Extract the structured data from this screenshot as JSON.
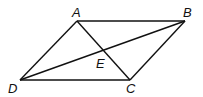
{
  "figure": {
    "type": "parallelogram with diagonals",
    "points": {
      "A": {
        "label": "A",
        "x": 77,
        "y": 21,
        "lx": 72,
        "ly": 17
      },
      "B": {
        "label": "B",
        "x": 185,
        "y": 21,
        "lx": 183,
        "ly": 17
      },
      "C": {
        "label": "C",
        "x": 130,
        "y": 80,
        "lx": 126,
        "ly": 93
      },
      "D": {
        "label": "D",
        "x": 20,
        "y": 80,
        "lx": 8,
        "ly": 93
      },
      "E": {
        "label": "E",
        "x": 104,
        "y": 51,
        "lx": 96,
        "ly": 68
      }
    },
    "segments": [
      "AB",
      "BC",
      "CD",
      "DA",
      "AC",
      "BD"
    ]
  }
}
